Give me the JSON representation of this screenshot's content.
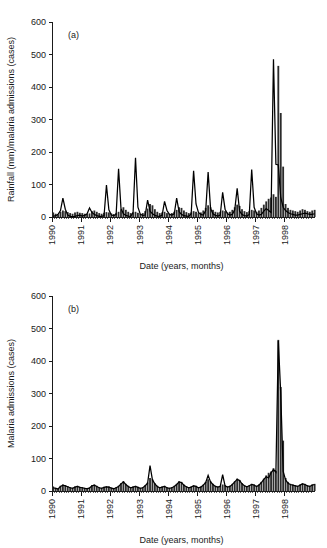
{
  "figure": {
    "panels": [
      {
        "tag": "(a)",
        "ylabel": "Rainfall (mm)/malaria admissions (cases)",
        "xlabel": "Date (years, months)"
      },
      {
        "tag": "(b)",
        "ylabel": "Malaria admissions (cases)",
        "xlabel": "Date (years, months)"
      }
    ]
  },
  "chart_data": [
    {
      "type": "bar",
      "panel": "(a)",
      "title": "",
      "xlabel": "Date (years, months)",
      "ylabel": "Rainfall (mm)/malaria admissions (cases)",
      "ylim": [
        0,
        600
      ],
      "yticks": [
        0,
        100,
        200,
        300,
        400,
        500,
        600
      ],
      "grid": false,
      "legend": "none",
      "x_tick_labels": [
        "1990",
        "1991",
        "1992",
        "1993",
        "1994",
        "1995",
        "1996",
        "1997",
        "1998"
      ],
      "x_tick_interval_months": 12,
      "x_start": "1990-01",
      "n_points": 107,
      "series": [
        {
          "name": "Malaria admissions (cases)",
          "render": "bar",
          "color": "#2b2b2b",
          "values": [
            14,
            10,
            8,
            16,
            20,
            18,
            15,
            12,
            10,
            14,
            16,
            13,
            12,
            10,
            9,
            11,
            18,
            20,
            16,
            12,
            10,
            13,
            15,
            14,
            11,
            9,
            12,
            16,
            24,
            30,
            22,
            16,
            12,
            14,
            16,
            13,
            10,
            12,
            18,
            26,
            40,
            36,
            24,
            16,
            12,
            14,
            16,
            12,
            10,
            12,
            16,
            22,
            30,
            28,
            20,
            15,
            12,
            14,
            18,
            16,
            12,
            14,
            20,
            28,
            36,
            30,
            22,
            16,
            14,
            16,
            20,
            18,
            14,
            16,
            22,
            30,
            38,
            34,
            24,
            18,
            15,
            18,
            22,
            20,
            16,
            20,
            28,
            38,
            48,
            56,
            60,
            70,
            62,
            465,
            320,
            155,
            40,
            28,
            22,
            20,
            18,
            16,
            20,
            24,
            22,
            18,
            16,
            20,
            22
          ]
        },
        {
          "name": "Rainfall (mm)",
          "render": "line",
          "color": "#000000",
          "values": [
            2,
            4,
            8,
            20,
            58,
            24,
            6,
            2,
            1,
            2,
            4,
            6,
            3,
            5,
            10,
            28,
            14,
            8,
            4,
            2,
            2,
            4,
            98,
            22,
            6,
            4,
            8,
            148,
            26,
            10,
            5,
            3,
            2,
            14,
            182,
            30,
            8,
            5,
            6,
            52,
            18,
            10,
            5,
            3,
            2,
            6,
            48,
            20,
            8,
            6,
            10,
            58,
            16,
            8,
            4,
            3,
            2,
            10,
            142,
            40,
            14,
            8,
            6,
            20,
            138,
            26,
            10,
            5,
            3,
            6,
            76,
            24,
            10,
            6,
            8,
            22,
            88,
            18,
            8,
            4,
            3,
            8,
            146,
            30,
            10,
            6,
            8,
            18,
            26,
            20,
            14,
            485,
            162,
            160,
            60,
            30,
            20,
            14,
            10,
            8,
            6,
            6,
            8,
            10,
            12,
            10,
            8,
            8,
            10
          ]
        }
      ]
    },
    {
      "type": "bar",
      "panel": "(b)",
      "title": "",
      "xlabel": "Date (years, months)",
      "ylabel": "Malaria admissions (cases)",
      "ylim": [
        0,
        600
      ],
      "yticks": [
        0,
        100,
        200,
        300,
        400,
        500,
        600
      ],
      "grid": false,
      "legend": "none",
      "x_tick_labels": [
        "1990",
        "1991",
        "1992",
        "1993",
        "1994",
        "1995",
        "1996",
        "1997",
        "1998"
      ],
      "x_tick_interval_months": 12,
      "x_start": "1990-01",
      "n_points": 107,
      "series": [
        {
          "name": "Malaria admissions (cases)",
          "render": "bar",
          "color": "#2b2b2b",
          "values": [
            14,
            10,
            8,
            16,
            20,
            18,
            15,
            12,
            10,
            14,
            16,
            13,
            12,
            10,
            9,
            11,
            18,
            20,
            16,
            12,
            10,
            13,
            15,
            14,
            11,
            9,
            12,
            16,
            24,
            30,
            22,
            16,
            12,
            14,
            16,
            13,
            10,
            12,
            18,
            26,
            40,
            36,
            24,
            16,
            12,
            14,
            16,
            12,
            10,
            12,
            16,
            22,
            30,
            28,
            20,
            15,
            12,
            14,
            18,
            16,
            12,
            14,
            20,
            28,
            36,
            30,
            22,
            16,
            14,
            16,
            20,
            18,
            14,
            16,
            22,
            30,
            38,
            34,
            24,
            18,
            15,
            18,
            22,
            20,
            16,
            20,
            28,
            38,
            48,
            56,
            60,
            70,
            62,
            465,
            320,
            155,
            40,
            28,
            22,
            20,
            18,
            16,
            20,
            24,
            22,
            18,
            16,
            20,
            22
          ]
        },
        {
          "name": "Malaria admissions (smoothed)",
          "render": "line",
          "color": "#000000",
          "values": [
            10,
            8,
            6,
            14,
            18,
            16,
            13,
            10,
            8,
            12,
            14,
            11,
            10,
            8,
            7,
            9,
            16,
            18,
            14,
            10,
            8,
            11,
            13,
            12,
            9,
            7,
            10,
            14,
            22,
            28,
            20,
            14,
            10,
            12,
            14,
            11,
            8,
            10,
            16,
            24,
            78,
            34,
            22,
            14,
            10,
            12,
            14,
            10,
            8,
            10,
            14,
            20,
            28,
            26,
            18,
            13,
            10,
            12,
            16,
            14,
            10,
            12,
            18,
            26,
            48,
            28,
            20,
            14,
            12,
            14,
            50,
            16,
            12,
            14,
            20,
            28,
            36,
            32,
            22,
            16,
            13,
            16,
            20,
            18,
            14,
            18,
            26,
            36,
            44,
            40,
            56,
            66,
            58,
            462,
            300,
            60,
            34,
            24,
            20,
            18,
            16,
            14,
            18,
            22,
            20,
            16,
            14,
            18,
            20
          ]
        }
      ]
    }
  ]
}
